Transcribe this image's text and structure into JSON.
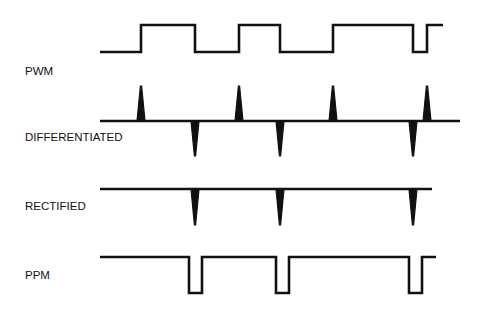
{
  "diagram": {
    "title": "",
    "signals": [
      {
        "id": "pwm",
        "label": "PWM",
        "kind": "square",
        "start_level": "low",
        "transitions": [
          {
            "t": 0.0,
            "edge": "start"
          },
          {
            "t": 41,
            "edge": "rise"
          },
          {
            "t": 95,
            "edge": "fall"
          },
          {
            "t": 139,
            "edge": "rise"
          },
          {
            "t": 180,
            "edge": "fall"
          },
          {
            "t": 233,
            "edge": "rise"
          },
          {
            "t": 313,
            "edge": "fall"
          },
          {
            "t": 327,
            "edge": "rise"
          },
          {
            "t": 343,
            "edge": "end"
          }
        ]
      },
      {
        "id": "differentiated",
        "label": "DIFFERENTIATED",
        "kind": "spikes",
        "end": 360,
        "spikes": [
          {
            "t": 41,
            "polarity": "positive"
          },
          {
            "t": 95,
            "polarity": "negative"
          },
          {
            "t": 139,
            "polarity": "positive"
          },
          {
            "t": 180,
            "polarity": "negative"
          },
          {
            "t": 233,
            "polarity": "positive"
          },
          {
            "t": 313,
            "polarity": "negative"
          },
          {
            "t": 327,
            "polarity": "positive"
          }
        ]
      },
      {
        "id": "rectified",
        "label": "RECTIFIED",
        "kind": "spikes",
        "end": 332,
        "spikes": [
          {
            "t": 95,
            "polarity": "negative"
          },
          {
            "t": 180,
            "polarity": "negative"
          },
          {
            "t": 313,
            "polarity": "negative"
          }
        ]
      },
      {
        "id": "ppm",
        "label": "PPM",
        "kind": "pulses",
        "start_level": "high",
        "end": 336,
        "pulse_width": 13,
        "pulses": [
          {
            "t": 89,
            "polarity": "negative"
          },
          {
            "t": 176,
            "polarity": "negative"
          },
          {
            "t": 309,
            "polarity": "negative"
          }
        ]
      }
    ]
  }
}
